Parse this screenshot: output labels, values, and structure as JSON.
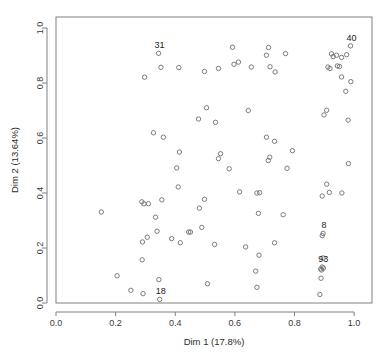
{
  "chart_data": {
    "type": "scatter",
    "title": "",
    "xlabel": "Dim 1 (17.8%)",
    "ylabel": "Dim 2 (13.64%)",
    "xlim": [
      0.0,
      1.06
    ],
    "ylim": [
      0.0,
      1.04
    ],
    "xticks": [
      "0.0",
      "0.2",
      "0.4",
      "0.6",
      "0.8",
      "1.0"
    ],
    "xtick_values": [
      0.0,
      0.2,
      0.4,
      0.6,
      0.8,
      1.0
    ],
    "yticks": [
      "0.0",
      "0.2",
      "0.4",
      "0.6",
      "0.8",
      "1.0"
    ],
    "ytick_values": [
      0.0,
      0.2,
      0.4,
      0.6,
      0.8,
      1.0
    ],
    "grid": false,
    "legend": "none",
    "marker": "open-circle",
    "marker_color": "#6e6e6e",
    "marker_radius": 2.2,
    "points": [
      {
        "x": 0.344,
        "y": 0.908,
        "label": "31"
      },
      {
        "x": 0.988,
        "y": 0.935,
        "label": "40"
      },
      {
        "x": 0.896,
        "y": 0.253,
        "label": "8"
      },
      {
        "x": 0.893,
        "y": 0.131,
        "label": "93"
      },
      {
        "x": 0.348,
        "y": 0.013,
        "label": "18"
      },
      {
        "x": 0.352,
        "y": 0.857,
        "label": ""
      },
      {
        "x": 0.297,
        "y": 0.821,
        "label": ""
      },
      {
        "x": 0.412,
        "y": 0.856,
        "label": ""
      },
      {
        "x": 0.498,
        "y": 0.842,
        "label": ""
      },
      {
        "x": 0.545,
        "y": 0.853,
        "label": ""
      },
      {
        "x": 0.592,
        "y": 0.93,
        "label": ""
      },
      {
        "x": 0.597,
        "y": 0.868,
        "label": ""
      },
      {
        "x": 0.612,
        "y": 0.876,
        "label": ""
      },
      {
        "x": 0.655,
        "y": 0.858,
        "label": ""
      },
      {
        "x": 0.706,
        "y": 0.901,
        "label": ""
      },
      {
        "x": 0.713,
        "y": 0.929,
        "label": ""
      },
      {
        "x": 0.718,
        "y": 0.859,
        "label": ""
      },
      {
        "x": 0.735,
        "y": 0.84,
        "label": ""
      },
      {
        "x": 0.77,
        "y": 0.907,
        "label": ""
      },
      {
        "x": 0.924,
        "y": 0.906,
        "label": ""
      },
      {
        "x": 0.93,
        "y": 0.896,
        "label": ""
      },
      {
        "x": 0.941,
        "y": 0.901,
        "label": ""
      },
      {
        "x": 0.958,
        "y": 0.893,
        "label": ""
      },
      {
        "x": 0.912,
        "y": 0.858,
        "label": ""
      },
      {
        "x": 0.919,
        "y": 0.853,
        "label": ""
      },
      {
        "x": 0.944,
        "y": 0.862,
        "label": ""
      },
      {
        "x": 0.951,
        "y": 0.86,
        "label": ""
      },
      {
        "x": 0.958,
        "y": 0.822,
        "label": ""
      },
      {
        "x": 0.975,
        "y": 0.903,
        "label": ""
      },
      {
        "x": 0.989,
        "y": 0.805,
        "label": ""
      },
      {
        "x": 0.972,
        "y": 0.77,
        "label": ""
      },
      {
        "x": 0.899,
        "y": 0.684,
        "label": ""
      },
      {
        "x": 0.908,
        "y": 0.701,
        "label": ""
      },
      {
        "x": 0.98,
        "y": 0.665,
        "label": ""
      },
      {
        "x": 0.505,
        "y": 0.71,
        "label": ""
      },
      {
        "x": 0.478,
        "y": 0.669,
        "label": ""
      },
      {
        "x": 0.535,
        "y": 0.657,
        "label": ""
      },
      {
        "x": 0.645,
        "y": 0.7,
        "label": ""
      },
      {
        "x": 0.327,
        "y": 0.619,
        "label": ""
      },
      {
        "x": 0.36,
        "y": 0.603,
        "label": ""
      },
      {
        "x": 0.706,
        "y": 0.603,
        "label": ""
      },
      {
        "x": 0.733,
        "y": 0.588,
        "label": ""
      },
      {
        "x": 0.414,
        "y": 0.549,
        "label": ""
      },
      {
        "x": 0.552,
        "y": 0.543,
        "label": ""
      },
      {
        "x": 0.545,
        "y": 0.525,
        "label": ""
      },
      {
        "x": 0.717,
        "y": 0.53,
        "label": ""
      },
      {
        "x": 0.712,
        "y": 0.518,
        "label": ""
      },
      {
        "x": 0.793,
        "y": 0.554,
        "label": ""
      },
      {
        "x": 0.981,
        "y": 0.507,
        "label": ""
      },
      {
        "x": 0.405,
        "y": 0.491,
        "label": ""
      },
      {
        "x": 0.581,
        "y": 0.488,
        "label": ""
      },
      {
        "x": 0.775,
        "y": 0.49,
        "label": ""
      },
      {
        "x": 0.908,
        "y": 0.432,
        "label": ""
      },
      {
        "x": 0.917,
        "y": 0.402,
        "label": ""
      },
      {
        "x": 0.959,
        "y": 0.4,
        "label": ""
      },
      {
        "x": 0.893,
        "y": 0.389,
        "label": ""
      },
      {
        "x": 0.41,
        "y": 0.422,
        "label": ""
      },
      {
        "x": 0.616,
        "y": 0.404,
        "label": ""
      },
      {
        "x": 0.674,
        "y": 0.4,
        "label": ""
      },
      {
        "x": 0.683,
        "y": 0.401,
        "label": ""
      },
      {
        "x": 0.288,
        "y": 0.368,
        "label": ""
      },
      {
        "x": 0.295,
        "y": 0.361,
        "label": ""
      },
      {
        "x": 0.31,
        "y": 0.361,
        "label": ""
      },
      {
        "x": 0.355,
        "y": 0.375,
        "label": ""
      },
      {
        "x": 0.498,
        "y": 0.377,
        "label": ""
      },
      {
        "x": 0.152,
        "y": 0.331,
        "label": ""
      },
      {
        "x": 0.481,
        "y": 0.345,
        "label": ""
      },
      {
        "x": 0.679,
        "y": 0.326,
        "label": ""
      },
      {
        "x": 0.762,
        "y": 0.321,
        "label": ""
      },
      {
        "x": 0.334,
        "y": 0.312,
        "label": ""
      },
      {
        "x": 0.339,
        "y": 0.261,
        "label": ""
      },
      {
        "x": 0.445,
        "y": 0.258,
        "label": ""
      },
      {
        "x": 0.451,
        "y": 0.258,
        "label": ""
      },
      {
        "x": 0.489,
        "y": 0.275,
        "label": ""
      },
      {
        "x": 0.306,
        "y": 0.239,
        "label": ""
      },
      {
        "x": 0.388,
        "y": 0.234,
        "label": ""
      },
      {
        "x": 0.29,
        "y": 0.222,
        "label": ""
      },
      {
        "x": 0.417,
        "y": 0.219,
        "label": ""
      },
      {
        "x": 0.532,
        "y": 0.213,
        "label": ""
      },
      {
        "x": 0.636,
        "y": 0.204,
        "label": ""
      },
      {
        "x": 0.733,
        "y": 0.219,
        "label": ""
      },
      {
        "x": 0.893,
        "y": 0.245,
        "label": ""
      },
      {
        "x": 0.681,
        "y": 0.174,
        "label": ""
      },
      {
        "x": 0.896,
        "y": 0.164,
        "label": ""
      },
      {
        "x": 0.888,
        "y": 0.124,
        "label": ""
      },
      {
        "x": 0.891,
        "y": 0.12,
        "label": ""
      },
      {
        "x": 0.897,
        "y": 0.127,
        "label": ""
      },
      {
        "x": 0.67,
        "y": 0.116,
        "label": ""
      },
      {
        "x": 0.289,
        "y": 0.157,
        "label": ""
      },
      {
        "x": 0.205,
        "y": 0.099,
        "label": ""
      },
      {
        "x": 0.345,
        "y": 0.085,
        "label": ""
      },
      {
        "x": 0.889,
        "y": 0.09,
        "label": ""
      },
      {
        "x": 0.508,
        "y": 0.07,
        "label": ""
      },
      {
        "x": 0.674,
        "y": 0.057,
        "label": ""
      },
      {
        "x": 0.251,
        "y": 0.046,
        "label": ""
      },
      {
        "x": 0.292,
        "y": 0.034,
        "label": ""
      },
      {
        "x": 0.885,
        "y": 0.031,
        "label": ""
      }
    ]
  },
  "plot_area": {
    "left": 56,
    "top": 17,
    "right": 372,
    "bottom": 303
  }
}
